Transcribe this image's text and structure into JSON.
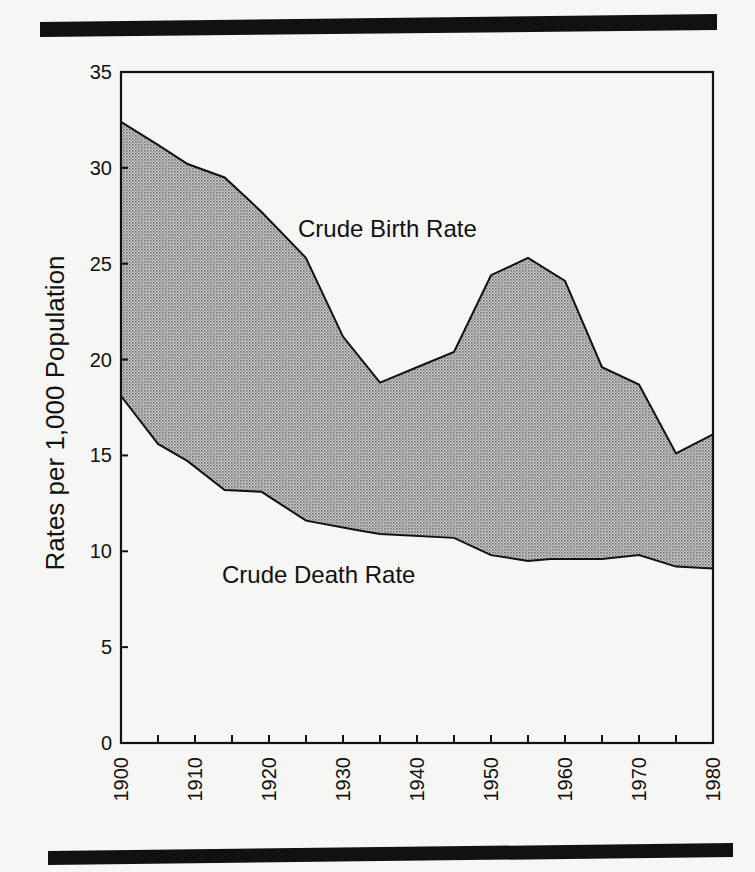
{
  "chart_data": {
    "type": "area",
    "title": "",
    "xlabel": "",
    "ylabel": "Rates per 1,000 Population",
    "xlim": [
      1900,
      1980
    ],
    "ylim": [
      0,
      35
    ],
    "x_ticks": [
      1900,
      1910,
      1920,
      1930,
      1940,
      1950,
      1960,
      1970,
      1980
    ],
    "x_minor_ticks": [
      1905,
      1915,
      1925,
      1935,
      1945,
      1955,
      1965,
      1975
    ],
    "y_ticks": [
      0,
      5,
      10,
      15,
      20,
      25,
      30,
      35
    ],
    "grid": false,
    "legend": "inline labels",
    "fill_between": "shaded region between birth rate (upper) and death rate (lower)",
    "series": [
      {
        "name": "Crude Birth Rate",
        "x": [
          1900,
          1905,
          1909,
          1914,
          1919,
          1925,
          1930,
          1935,
          1940,
          1945,
          1950,
          1955,
          1960,
          1965,
          1970,
          1975,
          1980
        ],
        "values": [
          32.4,
          31.2,
          30.2,
          29.5,
          27.7,
          25.3,
          21.2,
          18.8,
          19.6,
          20.4,
          24.4,
          25.3,
          24.1,
          19.6,
          18.7,
          15.1,
          16.1
        ]
      },
      {
        "name": "Crude Death Rate",
        "x": [
          1900,
          1905,
          1909,
          1914,
          1919,
          1925,
          1932,
          1935,
          1945,
          1950,
          1955,
          1958,
          1965,
          1970,
          1975,
          1980
        ],
        "values": [
          18.1,
          15.6,
          14.7,
          13.2,
          13.1,
          11.6,
          11.1,
          10.9,
          10.7,
          9.8,
          9.5,
          9.6,
          9.6,
          9.8,
          9.2,
          9.1
        ]
      }
    ],
    "annotations": [
      {
        "text": "Crude Birth Rate",
        "x": 1935,
        "y": 27
      },
      {
        "text": "Crude Death Rate",
        "x": 1932,
        "y": 9
      }
    ]
  },
  "labels": {
    "birth": "Crude Birth Rate",
    "death": "Crude Death Rate",
    "ylabel": "Rates per 1,000 Population"
  }
}
